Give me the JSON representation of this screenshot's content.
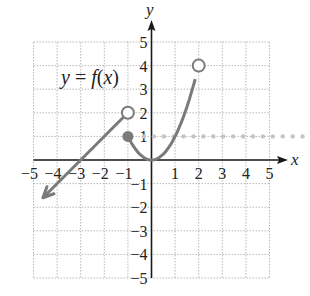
{
  "chart_data": {
    "type": "line",
    "title": "",
    "annotation": "y = f(x)",
    "xlabel": "x",
    "ylabel": "y",
    "xlim": [
      -5,
      5
    ],
    "ylim": [
      -5,
      5
    ],
    "grid": true,
    "x_ticks": [
      "-5",
      "-4",
      "-3",
      "-2",
      "-1",
      "1",
      "2",
      "3",
      "4",
      "5"
    ],
    "y_ticks": [
      "5",
      "4",
      "3",
      "2",
      "1",
      "-1",
      "-2",
      "-3",
      "-4",
      "-5"
    ],
    "series": [
      {
        "name": "piece 1: y = x + 3 (x < -1)",
        "style": "solid arrow ray",
        "points": [
          [
            -1,
            2
          ],
          [
            -3,
            0
          ],
          [
            -4.6,
            -1.6
          ]
        ],
        "end_markers": {
          "start": "open circle at (-1, 2)",
          "end": "arrow toward lower-left"
        }
      },
      {
        "name": "piece 2: y = x^2 (-1 <= x < 2)",
        "style": "solid curve",
        "points": [
          [
            -1,
            1
          ],
          [
            -0.5,
            0.25
          ],
          [
            0,
            0
          ],
          [
            0.5,
            0.25
          ],
          [
            1,
            1
          ],
          [
            1.5,
            2.25
          ],
          [
            2,
            4
          ]
        ],
        "end_markers": {
          "start": "closed dot at (-1, 1)",
          "end": "open circle at (2, 4)"
        }
      },
      {
        "name": "piece 3: y = 1 (x >= 2)",
        "style": "dotted light gray",
        "points": [
          [
            2,
            1
          ],
          [
            6.7,
            1
          ]
        ]
      }
    ]
  },
  "labels": {
    "annotation": "y = f(x)",
    "x_axis": "x",
    "y_axis": "y"
  },
  "colors": {
    "curve": "#7a7a7a",
    "axis": "#1a1a1a",
    "grid": "#b8b8b8",
    "dotted_line": "#c4c4c4"
  }
}
